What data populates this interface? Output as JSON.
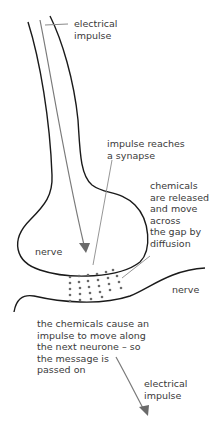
{
  "diagram": {
    "type": "synapse",
    "labels": {
      "electrical_impulse_top": "electrical\nimpulse",
      "impulse_reaches": "impulse reaches\na synapse",
      "chemicals_released": "chemicals\nare released\nand move\nacross\nthe gap by\ndiffusion",
      "nerve_left": "nerve",
      "nerve_right": "nerve",
      "chemicals_cause": "the chemicals cause an\nimpulse to move along\nthe next neurone – so\nthe message is\npassed on",
      "electrical_impulse_bottom": "electrical\nimpulse"
    },
    "colors": {
      "outline": "#1a1a1a",
      "arrow": "#7a7a7a",
      "dots": "#6a6a6a",
      "text": "#3a3a3a",
      "leader": "#8a8a8a"
    }
  }
}
